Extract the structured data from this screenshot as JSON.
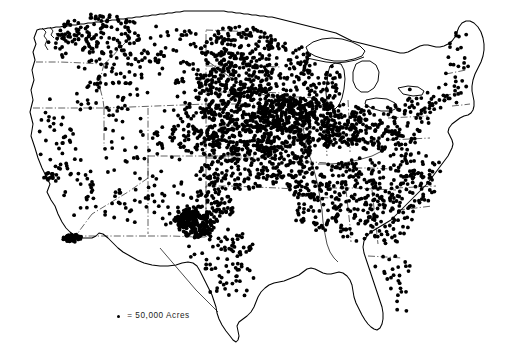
{
  "figure": {
    "type": "dot-density-map",
    "region": "United States (contiguous 48 states)",
    "background_color": "#ffffff",
    "ink_color": "#000000",
    "width": 517,
    "height": 352
  },
  "legend": {
    "marker_name": "legend-dot",
    "equals_sign": "=",
    "value_label": "50,000 Acres",
    "full_text": "= 50,000 Acres",
    "dot_color": "#000000"
  },
  "chart_data": {
    "type": "scatter",
    "title": "",
    "subtitle": "",
    "xlabel": "",
    "ylabel": "",
    "grid": false,
    "legend_position": "bottom-left",
    "dot_value": 50000,
    "dot_unit": "Acres",
    "dot_radius_px": 1.9,
    "legend_entries": [
      "= 50,000 Acres"
    ],
    "annotations": [],
    "region_densities": [
      {
        "name": "Corn Belt (Iowa, Illinois, Missouri, Nebraska)",
        "density": "very-high"
      },
      {
        "name": "Great Plains (Kansas, Oklahoma, Dakotas)",
        "density": "high"
      },
      {
        "name": "Texas Panhandle / West Texas",
        "density": "high-cluster"
      },
      {
        "name": "Eastern Washington (Palouse)",
        "density": "high"
      },
      {
        "name": "Mississippi Delta",
        "density": "medium"
      },
      {
        "name": "Southeast (Georgia, Alabama, Carolinas)",
        "density": "medium"
      },
      {
        "name": "Imperial Valley / Yuma",
        "density": "cluster"
      },
      {
        "name": "California Central Valley",
        "density": "cluster"
      },
      {
        "name": "Great Basin / Rocky Mountains",
        "density": "low"
      },
      {
        "name": "Northeast (New England, Maine)",
        "density": "low"
      },
      {
        "name": "Florida Peninsula",
        "density": "low"
      }
    ]
  }
}
